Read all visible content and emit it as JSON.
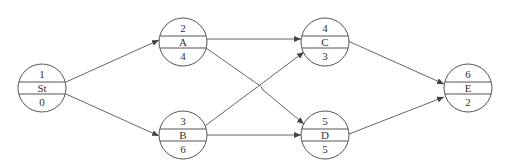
{
  "diagram": {
    "type": "activity-on-node network",
    "nodes": [
      {
        "id": "St",
        "top": "1",
        "middle": "St",
        "bottom": "0",
        "cx": 42,
        "cy": 88
      },
      {
        "id": "A",
        "top": "2",
        "middle": "A",
        "bottom": "4",
        "cx": 183,
        "cy": 42
      },
      {
        "id": "B",
        "top": "3",
        "middle": "B",
        "bottom": "6",
        "cx": 183,
        "cy": 135
      },
      {
        "id": "C",
        "top": "4",
        "middle": "C",
        "bottom": "3",
        "cx": 325,
        "cy": 42
      },
      {
        "id": "D",
        "top": "5",
        "middle": "D",
        "bottom": "5",
        "cx": 325,
        "cy": 135
      },
      {
        "id": "E",
        "top": "6",
        "middle": "E",
        "bottom": "2",
        "cx": 468,
        "cy": 88
      }
    ],
    "edges": [
      {
        "from": "St",
        "to": "A"
      },
      {
        "from": "St",
        "to": "B"
      },
      {
        "from": "A",
        "to": "C"
      },
      {
        "from": "A",
        "to": "D"
      },
      {
        "from": "B",
        "to": "C"
      },
      {
        "from": "B",
        "to": "D"
      },
      {
        "from": "C",
        "to": "E"
      },
      {
        "from": "D",
        "to": "E"
      }
    ],
    "colors": {
      "stroke": "#555555",
      "text": "#333333",
      "background": "#ffffff"
    }
  }
}
